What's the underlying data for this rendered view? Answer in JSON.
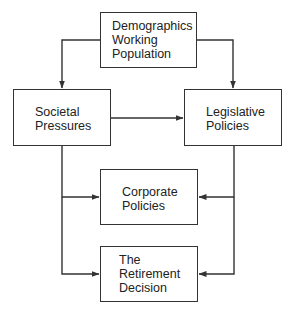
{
  "diagram": {
    "type": "flowchart",
    "nodes": [
      {
        "id": "demographics",
        "label": "Demographics\nWorking\nPopulation"
      },
      {
        "id": "societal",
        "label": "Societal\nPressures"
      },
      {
        "id": "legislative",
        "label": "Legislative\nPolicies"
      },
      {
        "id": "corporate",
        "label": "Corporate\nPolicies"
      },
      {
        "id": "retirement",
        "label": "The\nRetirement\nDecision"
      }
    ],
    "edges": [
      {
        "from": "demographics",
        "to": "societal"
      },
      {
        "from": "demographics",
        "to": "legislative"
      },
      {
        "from": "societal",
        "to": "legislative"
      },
      {
        "from": "societal",
        "to": "corporate"
      },
      {
        "from": "societal",
        "to": "retirement"
      },
      {
        "from": "legislative",
        "to": "corporate"
      },
      {
        "from": "legislative",
        "to": "retirement"
      }
    ],
    "colors": {
      "line": "#333333",
      "background": "#ffffff"
    }
  }
}
